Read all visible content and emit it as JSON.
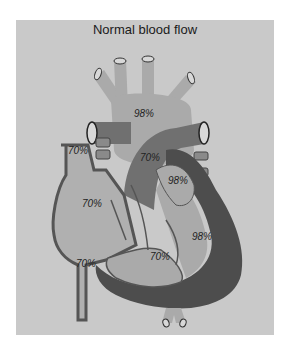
{
  "title": "Normal blood flow",
  "labels": {
    "aorta": "98%",
    "right_atrium_upper": "70%",
    "pulmonary_artery": "70%",
    "left_atrium": "98%",
    "right_atrium": "70%",
    "left_ventricle": "98%",
    "right_ventricle": "70%",
    "inferior_vena_cava": "70%"
  },
  "colors": {
    "background": "#c9c9c9",
    "oxygenated": "#aaaaaa",
    "deoxygenated": "#707070",
    "wall": "#4d4d4d"
  }
}
